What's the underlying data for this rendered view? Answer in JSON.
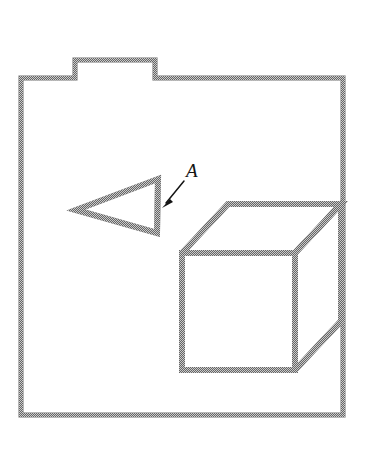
{
  "figure": {
    "background_color": "#ffffff",
    "stroke_color": "#3a3a3a",
    "label_color": "#141414",
    "canvas": {
      "width": 370,
      "height": 465
    }
  },
  "annotations": {
    "label_a": "A",
    "label_a_position": {
      "x": 186,
      "y": 161
    },
    "pointer": {
      "name": "arrow-to-prism",
      "from": {
        "x": 184,
        "y": 181
      },
      "to": {
        "x": 163,
        "y": 207
      }
    }
  },
  "shapes": {
    "tray": {
      "name": "tray-outline",
      "left": 21,
      "top": 78,
      "right": 343,
      "bottom": 415,
      "tab": {
        "left": 75,
        "right": 155,
        "top": 60
      }
    },
    "prism": {
      "name": "triangular-prism",
      "points": [
        {
          "x": 76,
          "y": 210
        },
        {
          "x": 158,
          "y": 179
        },
        {
          "x": 157,
          "y": 233
        }
      ]
    },
    "cube": {
      "name": "cube",
      "front_face": {
        "left": 182,
        "top": 253,
        "right": 295,
        "bottom": 370
      },
      "depth_offset": {
        "x": 46,
        "y": -49
      },
      "visible_faces": [
        "front",
        "top",
        "right"
      ]
    }
  }
}
